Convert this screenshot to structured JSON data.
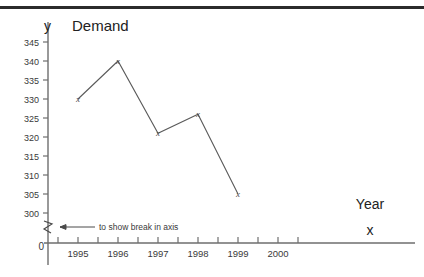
{
  "chart_data": {
    "type": "line",
    "title": "Demand",
    "xlabel": "Year",
    "ylabel": "",
    "x_axis_letter": "x",
    "y_axis_letter": "y",
    "categories": [
      "1995",
      "1996",
      "1997",
      "1998",
      "1999"
    ],
    "values": [
      330,
      340,
      321,
      326,
      305
    ],
    "series": [
      {
        "name": "Demand",
        "values": [
          330,
          340,
          321,
          326,
          305
        ]
      }
    ],
    "marker_symbol": "x",
    "ylim": [
      300,
      348
    ],
    "y_ticks": [
      300,
      305,
      310,
      315,
      320,
      325,
      330,
      335,
      340,
      345
    ],
    "y_tick_labels": [
      "300",
      "305",
      "310",
      "315",
      "320",
      "325",
      "330",
      "335",
      "340",
      "345"
    ],
    "y_zero_label": "0",
    "x_ticks": [
      "1995",
      "1996",
      "1997",
      "1998",
      "1999",
      "2000"
    ],
    "x_minor_tick_count": 13,
    "grid": false,
    "legend": "none",
    "axis_break": {
      "present": true,
      "annotation": "to show break in axis",
      "symbol": "zigzag"
    }
  },
  "colors": {
    "axis": "#6e6e6e",
    "series": "#5a5a5a",
    "text": "#222222",
    "tick_text": "#3a3a3a",
    "rule": "#2b2b2b",
    "background": "#ffffff"
  }
}
